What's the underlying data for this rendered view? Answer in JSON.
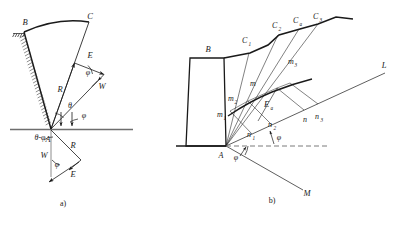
{
  "figure": {
    "background_color": "#ffffff",
    "line_color": "#1a1a1a",
    "dash_color": "#7a7a7a"
  },
  "panel_a": {
    "caption": "a)",
    "points": {
      "B": "B",
      "C": "C",
      "A": "A"
    },
    "forces": {
      "R_upper": "R",
      "E_upper": "E",
      "W_upper": "W",
      "R_lower": "R",
      "E_lower": "E",
      "W_lower": "W"
    },
    "angles": {
      "theta": "θ",
      "phi_upper_1": "φ",
      "phi_upper_2": "φ",
      "phi_lower": "φ",
      "theta_minus_phi": "θ-φ"
    }
  },
  "panel_b": {
    "caption": "b)",
    "points": {
      "B": "B",
      "A": "A",
      "L": "L",
      "M": "M"
    },
    "surface_points": {
      "C1": "C",
      "C1_sub": "1",
      "C2": "C",
      "C2_sub": "2",
      "Ca": "C",
      "Ca_sub": "a",
      "C3": "C",
      "C3_sub": "3"
    },
    "m_points": {
      "m1": "m",
      "m1_sub": "1",
      "m2": "m",
      "m2_sub": "2",
      "m": "m",
      "m_sub": "",
      "m3": "m",
      "m3_sub": "3"
    },
    "n_points": {
      "n1": "n",
      "n1_sub": "1",
      "n2": "n",
      "n2_sub": "2",
      "n": "n",
      "n_sub": "",
      "n3": "n",
      "n3_sub": "3"
    },
    "resultant": {
      "label": "E",
      "sub": "a"
    },
    "angles": {
      "phi_at_A": "φ",
      "phi_at_n2": "φ"
    }
  }
}
